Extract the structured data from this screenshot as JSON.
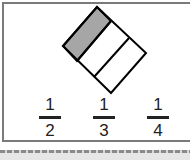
{
  "figure": {
    "parts": 3,
    "shaded_parts": 1,
    "shade_color": "#a6a6a6",
    "stroke_color": "#000000"
  },
  "options": [
    {
      "numerator": "1",
      "denominator": "2"
    },
    {
      "numerator": "1",
      "denominator": "3"
    },
    {
      "numerator": "1",
      "denominator": "4"
    }
  ]
}
